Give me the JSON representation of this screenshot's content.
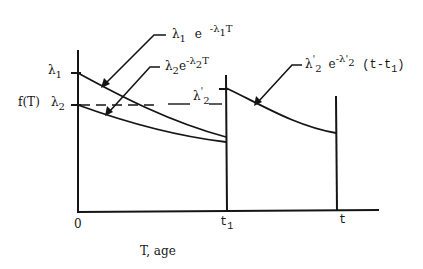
{
  "diagram": {
    "type": "failure-rate-vs-age",
    "stroke_color": "#151515",
    "axes": {
      "y_label": "f(T)",
      "x_label": "T, age",
      "origin_label": "0",
      "x_ticks": [
        {
          "label_main": "t",
          "label_sub": "1"
        },
        {
          "label_main": "t",
          "label_sub": ""
        }
      ],
      "y_ticks": [
        {
          "label_main": "λ",
          "label_sub": "1"
        },
        {
          "label_main": "λ",
          "label_sub": "2"
        }
      ]
    },
    "dashed_level_label": {
      "main": "λ",
      "prime": "'",
      "sub": "2"
    },
    "curves": [
      {
        "name": "curve-lambda1",
        "label_parts": {
          "coef": "λ",
          "coef_sub": "1",
          "base": "e",
          "exp": "-λ",
          "exp_sub": "1",
          "exp_tail": "T"
        }
      },
      {
        "name": "curve-lambda2",
        "label_parts": {
          "coef": "λ",
          "coef_sub": "2",
          "base": "e",
          "exp": "-λ",
          "exp_sub": "2",
          "exp_tail": "T"
        }
      },
      {
        "name": "curve-lambda2-prime",
        "label_parts": {
          "coef": "λ",
          "coef_prime": "'",
          "coef_sub": "2",
          "base": "e",
          "exp": "-λ",
          "exp_prime": "'",
          "exp_sub": "2",
          "exp_tail": "(t-t",
          "exp_tail_sub": "1",
          "exp_tail_end": ")"
        }
      }
    ]
  }
}
